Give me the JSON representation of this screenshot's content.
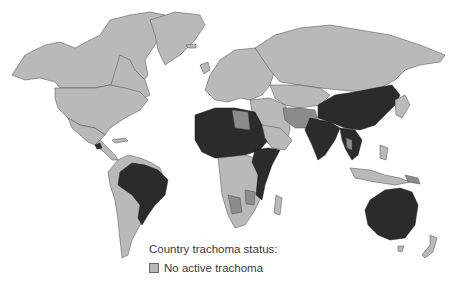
{
  "map": {
    "type": "choropleth world map",
    "subject": "Country trachoma status",
    "colors": {
      "no_active_trachoma": "#b9b9b9",
      "intermediate_status": "#8c8c8c",
      "endemic": "#2b2b2b",
      "ocean": "#ffffff"
    },
    "dark_regions": [
      "Brazil",
      "Sahel & North-central Africa",
      "East Africa",
      "India",
      "China",
      "Southeast Asia",
      "Australia",
      "Guatemala"
    ],
    "mid_regions": [
      "Libya",
      "Iran",
      "Afghanistan",
      "Parts of Southern Africa",
      "Papua New Guinea"
    ]
  },
  "legend": {
    "title": "Country trachoma status:",
    "items": [
      {
        "label": "No active trachoma",
        "color": "#b9b9b9"
      }
    ]
  }
}
